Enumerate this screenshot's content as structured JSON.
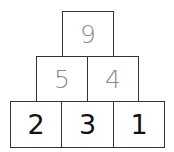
{
  "pyramid": {
    "top": [
      {
        "value": "9"
      }
    ],
    "middle": [
      {
        "value": "5"
      },
      {
        "value": "4"
      }
    ],
    "bottom": [
      {
        "value": "2"
      },
      {
        "value": "3"
      },
      {
        "value": "1"
      }
    ]
  },
  "colors": {
    "given_text": "#111111",
    "derived_text": "#8a8a8a",
    "border": "#333333"
  }
}
